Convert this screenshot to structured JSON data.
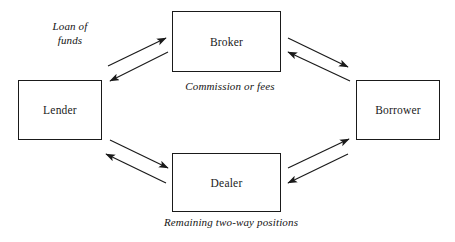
{
  "diagram": {
    "background_color": "#ffffff",
    "line_color": "#1a1a1a",
    "nodes": [
      {
        "id": "lender",
        "label": "Lender",
        "x": 18,
        "y": 80,
        "w": 84,
        "h": 60
      },
      {
        "id": "broker",
        "label": "Broker",
        "x": 172,
        "y": 11,
        "w": 109,
        "h": 61
      },
      {
        "id": "borrower",
        "label": "Borrower",
        "x": 356,
        "y": 80,
        "w": 84,
        "h": 60
      },
      {
        "id": "dealer",
        "label": "Dealer",
        "x": 172,
        "y": 153,
        "w": 109,
        "h": 59
      }
    ],
    "edge_labels": [
      {
        "id": "loan-of-funds",
        "text": "Loan of\nfunds",
        "x": 28,
        "y": 20,
        "w": 84
      },
      {
        "id": "commission",
        "text": "Commission or fees",
        "x": 166,
        "y": 80,
        "w": 128
      },
      {
        "id": "two-way",
        "text": "Remaining two-way positions",
        "x": 141,
        "y": 216,
        "w": 180
      }
    ],
    "connections": [
      {
        "id": "lender-to-broker",
        "from": "lender",
        "to": "broker",
        "direction": "bidirectional",
        "arrows": [
          {
            "id": "lender-broker-outbound",
            "x1": 108,
            "y1": 66,
            "x2": 166,
            "y2": 38,
            "head": "end"
          },
          {
            "id": "broker-lender-inbound",
            "x1": 168,
            "y1": 52,
            "x2": 110,
            "y2": 81,
            "head": "end"
          }
        ]
      },
      {
        "id": "broker-to-borrower",
        "from": "broker",
        "to": "borrower",
        "direction": "bidirectional",
        "arrows": [
          {
            "id": "broker-borrower-outbound",
            "x1": 288,
            "y1": 38,
            "x2": 348,
            "y2": 67,
            "head": "end"
          },
          {
            "id": "borrower-broker-inbound",
            "x1": 350,
            "y1": 81,
            "x2": 288,
            "y2": 52,
            "head": "end"
          }
        ]
      },
      {
        "id": "lender-to-dealer",
        "from": "lender",
        "to": "dealer",
        "direction": "bidirectional",
        "arrows": [
          {
            "id": "lender-dealer-outbound",
            "x1": 110,
            "y1": 140,
            "x2": 168,
            "y2": 168,
            "head": "end"
          },
          {
            "id": "dealer-lender-inbound",
            "x1": 166,
            "y1": 183,
            "x2": 106,
            "y2": 154,
            "head": "end"
          }
        ]
      },
      {
        "id": "dealer-to-borrower",
        "from": "dealer",
        "to": "borrower",
        "direction": "bidirectional",
        "arrows": [
          {
            "id": "dealer-borrower-outbound",
            "x1": 288,
            "y1": 168,
            "x2": 349,
            "y2": 139,
            "head": "end"
          },
          {
            "id": "borrower-dealer-inbound",
            "x1": 348,
            "y1": 154,
            "x2": 288,
            "y2": 183,
            "head": "end"
          }
        ]
      }
    ]
  }
}
